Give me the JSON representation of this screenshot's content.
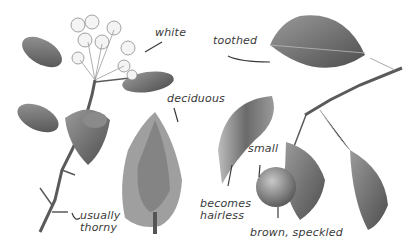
{
  "illustration": {
    "subject": "pear tree botanical illustration",
    "colors": {
      "background": "#ffffff",
      "label_text": "#3a3a3a",
      "leader_line": "#3a3a3a",
      "foliage": "#6e6e6e",
      "branch": "#4a4a4a",
      "fruit": "#7a7a7a"
    },
    "labels": [
      {
        "id": "white",
        "text": "white"
      },
      {
        "id": "toothed",
        "text": "toothed"
      },
      {
        "id": "deciduous",
        "text": "deciduous"
      },
      {
        "id": "small",
        "text": "small"
      },
      {
        "id": "becomes_hairless_1",
        "text": "becomes"
      },
      {
        "id": "becomes_hairless_2",
        "text": "hairless"
      },
      {
        "id": "usually_thorny_1",
        "text": "usually"
      },
      {
        "id": "usually_thorny_2",
        "text": "thorny"
      },
      {
        "id": "brown_speckled",
        "text": "brown, speckled"
      }
    ]
  }
}
